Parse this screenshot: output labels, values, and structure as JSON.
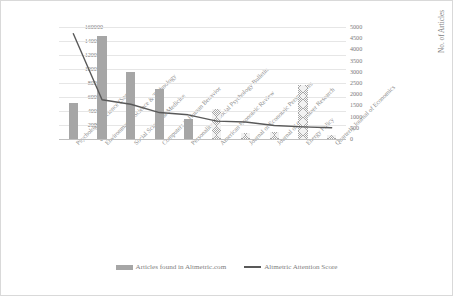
{
  "chart_data": {
    "type": "bar",
    "title": "",
    "subtitle": "",
    "xlabel": "",
    "ylabel": "AAS on journal level",
    "y2label": "No. of Articles",
    "ylim": [
      0,
      160000
    ],
    "y2lim": [
      0,
      5000
    ],
    "grid": true,
    "legend_position": "bottom",
    "categories": [
      "Psychological Science (Sage...",
      "Environmental Science & Technology",
      "Social Science & Medicine",
      "Computers in Human Behavior",
      "Personality & Social Psychology Bulletin",
      "American Economic Review",
      "Journal of Economic Perspectives",
      "Journal of Consumer Research",
      "Energy Policy",
      "Quarterly Journal of Economics"
    ],
    "series": [
      {
        "name": "Articles found in Altmetric.com",
        "type": "bar",
        "axis": "right",
        "color": "#a6a6a6",
        "values": [
          1600,
          4600,
          3000,
          2250,
          880,
          1350,
          250,
          330,
          2400,
          180
        ]
      },
      {
        "name": "Altmetric Attention Score",
        "type": "line",
        "axis": "right",
        "color": "#595959",
        "values": [
          4700,
          1750,
          1550,
          1180,
          1080,
          800,
          760,
          600,
          540,
          500
        ]
      }
    ],
    "y_ticks_left": [
      "0",
      "20000",
      "40000",
      "60000",
      "80000",
      "100000",
      "120000",
      "140000",
      "160000"
    ],
    "y_ticks_right": [
      "0",
      "500",
      "1000",
      "1500",
      "2000",
      "2500",
      "3000",
      "3500",
      "4000",
      "4500",
      "5000"
    ]
  },
  "legend": {
    "items": [
      {
        "label": "Articles found in Altmetric.com",
        "marker": "bar-swatch"
      },
      {
        "label": "Altmetric Attention Score",
        "marker": "line-swatch"
      }
    ]
  }
}
